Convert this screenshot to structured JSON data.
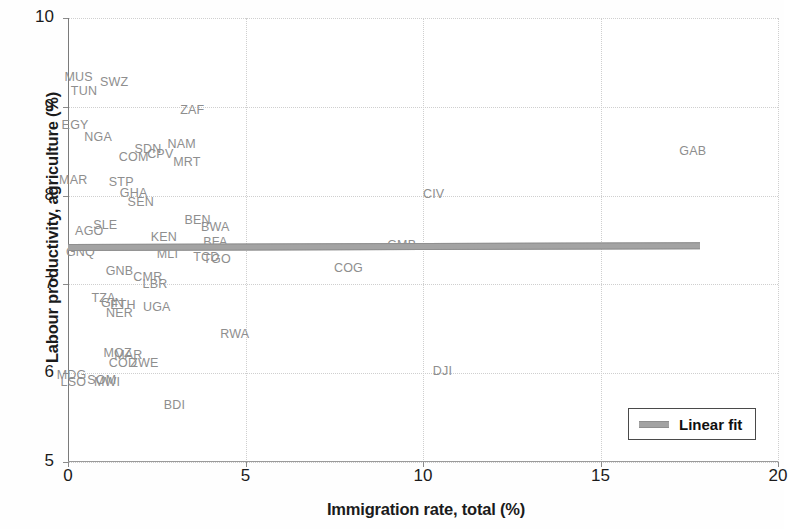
{
  "chart_data": {
    "type": "scatter",
    "title": "",
    "xlabel": "Immigration rate, total (%)",
    "ylabel": "Labour productivity, agriculture (%)",
    "xlim": [
      0,
      20
    ],
    "ylim": [
      5,
      10
    ],
    "xticks": [
      "0",
      "5",
      "10",
      "15",
      "20"
    ],
    "yticks": [
      "5",
      "6",
      "7",
      "8",
      "9",
      "10"
    ],
    "grid": true,
    "legend_position": "bottom-right",
    "series": [
      {
        "name": "Linear fit",
        "type": "line",
        "color": "#a3a3a3",
        "x": [
          0.0,
          17.8
        ],
        "y": [
          7.43,
          7.45
        ]
      },
      {
        "name": "Countries",
        "type": "scatter-labels",
        "label_color": "#8e8e8e",
        "points": [
          {
            "label": "MUS",
            "x": 0.3,
            "y": 9.33
          },
          {
            "label": "SWZ",
            "x": 1.3,
            "y": 9.28
          },
          {
            "label": "TUN",
            "x": 0.45,
            "y": 9.18
          },
          {
            "label": "ZAF",
            "x": 3.5,
            "y": 8.96
          },
          {
            "label": "EGY",
            "x": 0.2,
            "y": 8.79
          },
          {
            "label": "NGA",
            "x": 0.85,
            "y": 8.66
          },
          {
            "label": "NAM",
            "x": 3.2,
            "y": 8.58
          },
          {
            "label": "SDN",
            "x": 2.25,
            "y": 8.52
          },
          {
            "label": "CPV",
            "x": 2.6,
            "y": 8.47
          },
          {
            "label": "COM",
            "x": 1.85,
            "y": 8.44
          },
          {
            "label": "GAB",
            "x": 17.6,
            "y": 8.5
          },
          {
            "label": "MRT",
            "x": 3.35,
            "y": 8.38
          },
          {
            "label": "MAR",
            "x": 0.15,
            "y": 8.18
          },
          {
            "label": "STP",
            "x": 1.5,
            "y": 8.15
          },
          {
            "label": "GHA",
            "x": 1.85,
            "y": 8.03
          },
          {
            "label": "CIV",
            "x": 10.3,
            "y": 8.02
          },
          {
            "label": "SEN",
            "x": 2.05,
            "y": 7.93
          },
          {
            "label": "BEN",
            "x": 3.65,
            "y": 7.73
          },
          {
            "label": "SLE",
            "x": 1.05,
            "y": 7.67
          },
          {
            "label": "BWA",
            "x": 4.15,
            "y": 7.65
          },
          {
            "label": "AGO",
            "x": 0.6,
            "y": 7.6
          },
          {
            "label": "KEN",
            "x": 2.7,
            "y": 7.53
          },
          {
            "label": "BFA",
            "x": 4.15,
            "y": 7.48
          },
          {
            "label": "GMB",
            "x": 9.4,
            "y": 7.44
          },
          {
            "label": "GNQ",
            "x": 0.35,
            "y": 7.36
          },
          {
            "label": "MLI",
            "x": 2.8,
            "y": 7.34
          },
          {
            "label": "TCD",
            "x": 3.9,
            "y": 7.31
          },
          {
            "label": "TGO",
            "x": 4.2,
            "y": 7.29
          },
          {
            "label": "COG",
            "x": 7.9,
            "y": 7.19
          },
          {
            "label": "GNB",
            "x": 1.45,
            "y": 7.15
          },
          {
            "label": "CMR",
            "x": 2.25,
            "y": 7.08
          },
          {
            "label": "LBR",
            "x": 2.45,
            "y": 7.0
          },
          {
            "label": "TZA",
            "x": 1.0,
            "y": 6.85
          },
          {
            "label": "GIN",
            "x": 1.25,
            "y": 6.79
          },
          {
            "label": "ETH",
            "x": 1.55,
            "y": 6.77
          },
          {
            "label": "UGA",
            "x": 2.5,
            "y": 6.75
          },
          {
            "label": "NER",
            "x": 1.45,
            "y": 6.68
          },
          {
            "label": "RWA",
            "x": 4.7,
            "y": 6.44
          },
          {
            "label": "MOZ",
            "x": 1.4,
            "y": 6.23
          },
          {
            "label": "MAR2",
            "x": 1.7,
            "y": 6.21
          },
          {
            "label": "COD",
            "x": 1.55,
            "y": 6.12
          },
          {
            "label": "ZWE",
            "x": 2.15,
            "y": 6.11
          },
          {
            "label": "DJI",
            "x": 10.55,
            "y": 6.02
          },
          {
            "label": "MDG",
            "x": 0.1,
            "y": 5.98
          },
          {
            "label": "SOM",
            "x": 0.95,
            "y": 5.92
          },
          {
            "label": "LSO",
            "x": 0.15,
            "y": 5.9
          },
          {
            "label": "MWI",
            "x": 1.1,
            "y": 5.9
          },
          {
            "label": "BDI",
            "x": 3.0,
            "y": 5.64
          }
        ]
      }
    ]
  },
  "legend": {
    "label": "Linear fit"
  }
}
